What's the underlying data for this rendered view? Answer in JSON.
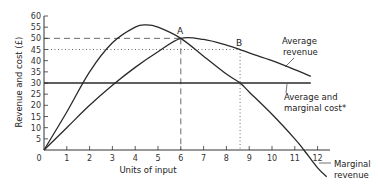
{
  "chart_data": {
    "type": "line",
    "title": "",
    "xlabel": "Units of input",
    "ylabel": "Revenue and cost (£)",
    "xlim": [
      0,
      12.5
    ],
    "ylim": [
      -12,
      60
    ],
    "x_ticks": [
      0,
      1,
      2,
      3,
      4,
      5,
      6,
      7,
      8,
      9,
      10,
      11,
      12
    ],
    "y_ticks": [
      0,
      5,
      10,
      15,
      20,
      25,
      30,
      35,
      40,
      45,
      50,
      55,
      60
    ],
    "grid": false,
    "series": [
      {
        "name": "Marginal revenue",
        "style": "solid",
        "x": [
          0,
          1,
          2,
          3,
          4,
          4.5,
          5,
          6,
          7,
          8,
          8.6,
          9,
          10,
          11,
          11.4,
          12,
          12.4
        ],
        "y": [
          0,
          17,
          35,
          48,
          55,
          56,
          55,
          50,
          42,
          34,
          30,
          26,
          16,
          5,
          0,
          -8,
          -12
        ]
      },
      {
        "name": "Average revenue",
        "style": "solid",
        "x": [
          0,
          1,
          2,
          3,
          4,
          5,
          6,
          7,
          8,
          8.6,
          9,
          10,
          11,
          11.7
        ],
        "y": [
          0,
          10,
          20,
          29,
          37,
          44,
          50,
          49.5,
          47,
          45,
          43.5,
          40,
          36,
          33
        ]
      },
      {
        "name": "Average and marginal cost*",
        "style": "solid",
        "x": [
          0,
          11.7
        ],
        "y": [
          30,
          30
        ]
      }
    ],
    "reference_lines": [
      {
        "label": "A",
        "x": 6,
        "y": 50,
        "style": "dashed"
      },
      {
        "label": "B",
        "x": 8.6,
        "y": 45,
        "style": "dotted"
      }
    ],
    "annotations": [
      {
        "text": [
          "Average",
          "revenue"
        ],
        "points_to": "Average revenue"
      },
      {
        "text": [
          "Average and",
          "marginal cost*"
        ],
        "points_to": "Average and marginal cost*"
      },
      {
        "text": [
          "Marginal",
          "revenue"
        ],
        "points_to": "Marginal revenue"
      }
    ],
    "legend": "none (inline annotations)"
  },
  "labels": {
    "xlabel": "Units of input",
    "ylabel": "Revenue and cost (£)",
    "point_a": "A",
    "point_b": "B",
    "ar_line1": "Average",
    "ar_line2": "revenue",
    "cost_line1": "Average and",
    "cost_line2": "marginal cost*",
    "mr_line1": "Marginal",
    "mr_line2": "revenue"
  }
}
